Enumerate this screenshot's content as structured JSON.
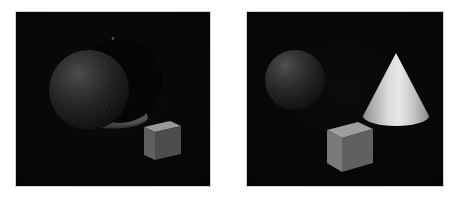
{
  "figure": {
    "panel_count": 2,
    "background_color": "#ffffff",
    "panel_border_color": "#d2d2d2",
    "panel_background_color": "#050505"
  },
  "panels": [
    {
      "id": "left",
      "name": "left-scene",
      "label": "Left scene",
      "frame": {
        "x": 15,
        "y": 11,
        "width": 196,
        "height": 176
      },
      "lighting": "dim, low-key illumination; most surfaces fall off to near black",
      "objects": [
        {
          "name": "sphere",
          "shape": "sphere",
          "label": "Sphere",
          "color": "#343434",
          "highlight_color": "#4a4a4a",
          "center": {
            "x": 73,
            "y": 78
          },
          "radius": 40,
          "brightness": "dim",
          "texture": "matte, grainy",
          "occludes": "cone",
          "depth_order": 2
        },
        {
          "name": "cone",
          "shape": "cone",
          "label": "Cone",
          "color": "#cfcfcf",
          "shadow_color": "#3a3a3a",
          "apex": {
            "x": 96,
            "y": 26
          },
          "base_center": {
            "x": 96,
            "y": 112
          },
          "base_radius": 34,
          "brightness": "bright right sliver, dark left sliver",
          "visibility": "mostly hidden behind sphere",
          "depth_order": 1
        },
        {
          "name": "cube",
          "shape": "cube",
          "label": "Cube",
          "color": "#555555",
          "top_face_color": "#9a9a9a",
          "left_face_color": "#5a5a5a",
          "right_face_color": "#4a4a4a",
          "center": {
            "x": 144,
            "y": 127
          },
          "size": 34,
          "brightness": "medium-dim",
          "depth_order": 3
        }
      ]
    },
    {
      "id": "right",
      "name": "right-scene",
      "label": "Right scene",
      "frame": {
        "x": 246,
        "y": 11,
        "width": 198,
        "height": 176
      },
      "lighting": "brighter key light from upper left; cone and cube clearly lit",
      "objects": [
        {
          "name": "sphere",
          "shape": "sphere",
          "label": "Sphere",
          "color": "#383838",
          "highlight_color": "#4f4f4f",
          "center": {
            "x": 48,
            "y": 68
          },
          "radius": 30,
          "brightness": "dim",
          "texture": "matte, grainy",
          "depth_order": 1
        },
        {
          "name": "cone",
          "shape": "cone",
          "label": "Cone",
          "color": "#c9c9c9",
          "highlight_color": "#e6e6e6",
          "shadow_color": "#8d8d8d",
          "apex": {
            "x": 148,
            "y": 42
          },
          "base_center": {
            "x": 148,
            "y": 108
          },
          "base_radius": 32,
          "brightness": "bright",
          "depth_order": 2
        },
        {
          "name": "cube",
          "shape": "cube",
          "label": "Cube",
          "color": "#707070",
          "top_face_color": "#9e9e9e",
          "left_face_color": "#757575",
          "right_face_color": "#5e5e5e",
          "center": {
            "x": 102,
            "y": 133
          },
          "size": 42,
          "brightness": "medium-bright",
          "depth_order": 3
        }
      ]
    }
  ]
}
